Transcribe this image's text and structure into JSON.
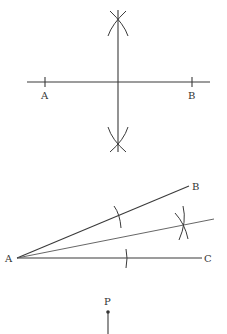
{
  "figures": [
    {
      "name": "perpendicular-bisector",
      "labels": {
        "a": "A",
        "b": "B"
      }
    },
    {
      "name": "angle-bisector",
      "labels": {
        "a": "A",
        "b": "B",
        "c": "C"
      }
    },
    {
      "name": "perpendicular-from-point",
      "labels": {
        "p": "P"
      }
    }
  ],
  "colors": {
    "stroke": "#3a3a3a",
    "background": "#ffffff"
  }
}
